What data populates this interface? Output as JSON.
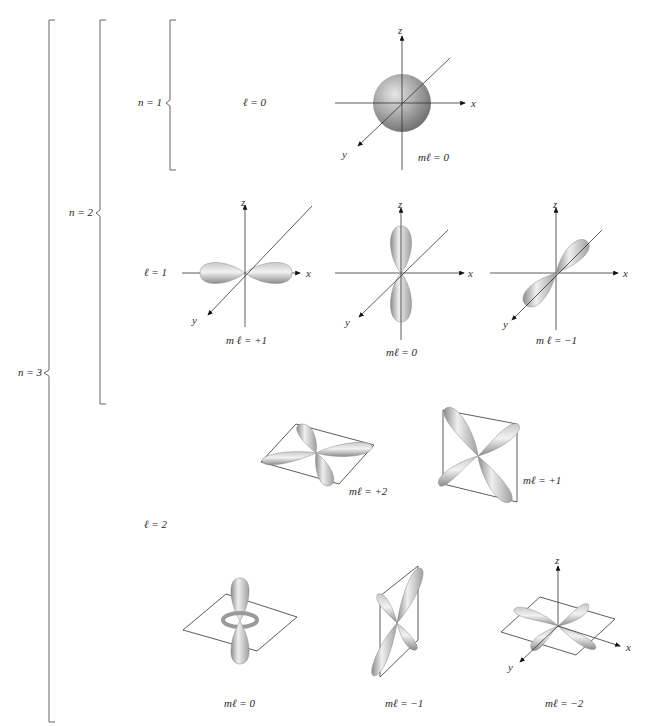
{
  "figure": {
    "brackets": {
      "n3": {
        "label": "n = 3"
      },
      "n2": {
        "label": "n = 2"
      },
      "n1": {
        "label": "n = 1"
      }
    },
    "subshells": [
      {
        "label": "ℓ = 0",
        "orbitals": [
          {
            "id": "s",
            "ml_label": "mℓ = 0"
          }
        ]
      },
      {
        "label": "ℓ = 1",
        "orbitals": [
          {
            "id": "px",
            "ml_label": "m ℓ = +1"
          },
          {
            "id": "pz",
            "ml_label": "mℓ = 0"
          },
          {
            "id": "py",
            "ml_label": "m ℓ = −1"
          }
        ]
      },
      {
        "label": "ℓ = 2",
        "orbitals": [
          {
            "id": "d+2",
            "ml_label": "mℓ = +2"
          },
          {
            "id": "d+1",
            "ml_label": "mℓ = +1"
          },
          {
            "id": "d0",
            "ml_label": "mℓ = 0"
          },
          {
            "id": "d-1",
            "ml_label": "mℓ = −1"
          },
          {
            "id": "d-2",
            "ml_label": "mℓ = −2"
          }
        ]
      }
    ],
    "axes": {
      "x": "x",
      "y": "y",
      "z": "z"
    },
    "colors": {
      "lobe_light": "#f2f2f2",
      "lobe_dark": "#8a8a8a",
      "line": "#333333"
    }
  }
}
